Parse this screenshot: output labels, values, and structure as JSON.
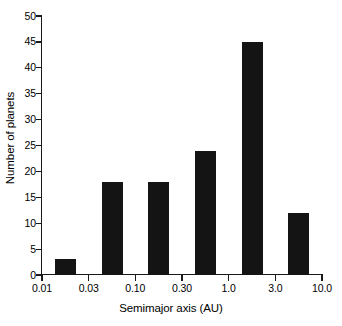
{
  "chart_data": {
    "type": "bar",
    "title": "",
    "subtitle": "",
    "xlabel": "Semimajor axis (AU)",
    "ylabel": "Number of planets",
    "xscale": "log",
    "xlim": [
      0.01,
      10.0
    ],
    "ylim": [
      0,
      50
    ],
    "grid": false,
    "legend": null,
    "xtick_labels": [
      "0.01",
      "0.03",
      "0.10",
      "0.30",
      "1.0",
      "3.0",
      "10.0"
    ],
    "xtick_values": [
      0.01,
      0.03,
      0.1,
      0.3,
      1.0,
      3.0,
      10.0
    ],
    "ytick_labels": [
      "0",
      "5",
      "10",
      "15",
      "20",
      "25",
      "30",
      "35",
      "40",
      "45",
      "50"
    ],
    "ytick_values": [
      0,
      5,
      10,
      15,
      20,
      25,
      30,
      35,
      40,
      45,
      50
    ],
    "bar_color": "#141414",
    "categories": [
      "0.01-0.03",
      "0.03-0.10",
      "0.10-0.30",
      "0.30-1.0",
      "1.0-3.0",
      "3.0-10.0"
    ],
    "values": [
      3,
      18,
      18,
      24,
      45,
      12
    ],
    "bars": [
      {
        "bin": "0.01-0.03",
        "value": 3,
        "bin_index": 0
      },
      {
        "bin": "0.03-0.10",
        "value": 18,
        "bin_index": 1
      },
      {
        "bin": "0.10-0.30",
        "value": 18,
        "bin_index": 2
      },
      {
        "bin": "0.30-1.0",
        "value": 24,
        "bin_index": 3
      },
      {
        "bin": "1.0-3.0",
        "value": 45,
        "bin_index": 4
      },
      {
        "bin": "3.0-10.0",
        "value": 12,
        "bin_index": 5
      }
    ]
  }
}
